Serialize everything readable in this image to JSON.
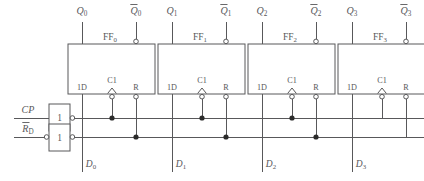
{
  "diagram": {
    "stroke_color": "#58585a",
    "junction_color": "#2b2b2b",
    "background": "#ffffff"
  },
  "inputs": {
    "clock": {
      "label": "CP",
      "italic": true
    },
    "reset": {
      "label": "R",
      "subscript": "D",
      "overbar": true
    }
  },
  "gates": [
    {
      "id": "clock-buffer",
      "label": "1",
      "input_bubble": false,
      "output_bubble": true
    },
    {
      "id": "reset-buffer",
      "label": "1",
      "input_bubble": true,
      "output_bubble": true
    }
  ],
  "flipflops": [
    {
      "name": "FF0",
      "name_base": "FF",
      "name_sub": "0",
      "q_label": "Q",
      "q_sub": "0",
      "qbar_label": "Q",
      "qbar_sub": "0",
      "qbar_overbar": true,
      "pin_d": "1D",
      "pin_clk": "C1",
      "pin_r": "R",
      "data_label": "D",
      "data_sub": "0",
      "clk_dynamic": true,
      "clk_bubble": true,
      "r_bubble": true,
      "qbar_bubble": true
    },
    {
      "name": "FF1",
      "name_base": "FF",
      "name_sub": "1",
      "q_label": "Q",
      "q_sub": "1",
      "qbar_label": "Q",
      "qbar_sub": "1",
      "qbar_overbar": true,
      "pin_d": "1D",
      "pin_clk": "C1",
      "pin_r": "R",
      "data_label": "D",
      "data_sub": "1",
      "clk_dynamic": true,
      "clk_bubble": true,
      "r_bubble": true,
      "qbar_bubble": true
    },
    {
      "name": "FF2",
      "name_base": "FF",
      "name_sub": "2",
      "q_label": "Q",
      "q_sub": "2",
      "qbar_label": "Q",
      "qbar_sub": "2",
      "qbar_overbar": true,
      "pin_d": "1D",
      "pin_clk": "C1",
      "pin_r": "R",
      "data_label": "D",
      "data_sub": "2",
      "clk_dynamic": true,
      "clk_bubble": true,
      "r_bubble": true,
      "qbar_bubble": true
    },
    {
      "name": "FF3",
      "name_base": "FF",
      "name_sub": "3",
      "q_label": "Q",
      "q_sub": "3",
      "qbar_label": "Q",
      "qbar_sub": "3",
      "qbar_overbar": true,
      "pin_d": "1D",
      "pin_clk": "C1",
      "pin_r": "R",
      "data_label": "D",
      "data_sub": "3",
      "clk_dynamic": true,
      "clk_bubble": true,
      "r_bubble": true,
      "qbar_bubble": true
    }
  ],
  "buses": {
    "clock_bus_label": "CP bus",
    "reset_bus_label": "reset bus",
    "clock_junction_count": 3,
    "reset_junction_count": 3
  }
}
